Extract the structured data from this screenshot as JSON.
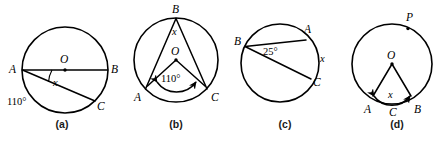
{
  "figure": {
    "type": "circle-geometry-diagram-set",
    "background_color": "#ffffff",
    "stroke_color": "#000000",
    "panel_count": 4
  },
  "panels": [
    {
      "id": "a",
      "caption": "(a)",
      "center_label": "O",
      "points": [
        {
          "name": "A",
          "label": "A",
          "position": "left"
        },
        {
          "name": "B",
          "label": "B",
          "position": "right"
        },
        {
          "name": "C",
          "label": "C",
          "position": "bottom-right"
        }
      ],
      "angle_labels": [
        {
          "label": "x",
          "at": "A",
          "type": "variable"
        },
        {
          "label": "110°",
          "at": "arc-AC",
          "type": "given"
        }
      ],
      "chords": [
        "AB",
        "AC"
      ],
      "notes": "AB is a diameter through center O; angle x at A between AB and AC; arc AC is 110 degrees"
    },
    {
      "id": "b",
      "caption": "(b)",
      "center_label": "O",
      "points": [
        {
          "name": "B",
          "label": "B",
          "position": "top"
        },
        {
          "name": "A",
          "label": "A",
          "position": "bottom-left"
        },
        {
          "name": "C",
          "label": "C",
          "position": "bottom-right"
        }
      ],
      "angle_labels": [
        {
          "label": "x",
          "at": "B",
          "type": "variable"
        },
        {
          "label": "110°",
          "at": "O",
          "type": "given"
        }
      ],
      "chords": [
        "BA",
        "BC"
      ],
      "radii": [
        "OA",
        "OC"
      ],
      "notes": "Central angle AOC is 110 degrees marked with double headed arc arrow; inscribed angle x at B"
    },
    {
      "id": "c",
      "caption": "(c)",
      "center_label": "",
      "points": [
        {
          "name": "B",
          "label": "B",
          "position": "left"
        },
        {
          "name": "A",
          "label": "A",
          "position": "top-right"
        },
        {
          "name": "C",
          "label": "C",
          "position": "right"
        }
      ],
      "angle_labels": [
        {
          "label": "25°",
          "at": "B",
          "type": "given"
        },
        {
          "label": "x",
          "at": "arc-AC",
          "type": "variable"
        }
      ],
      "chords": [
        "BA",
        "BC"
      ],
      "notes": "Inscribed angle at B is 25 degrees; x labels arc AC on the right"
    },
    {
      "id": "d",
      "caption": "(d)",
      "center_label": "O",
      "points": [
        {
          "name": "P",
          "label": "P",
          "position": "top-right"
        },
        {
          "name": "A",
          "label": "A",
          "position": "bottom-left"
        },
        {
          "name": "C",
          "label": "C",
          "position": "bottom"
        },
        {
          "name": "B",
          "label": "B",
          "position": "bottom-right"
        }
      ],
      "angle_labels": [
        {
          "label": "x",
          "at": "arc-ACB",
          "type": "variable"
        }
      ],
      "radii": [
        "OA",
        "OB"
      ],
      "notes": "Radii OA and OB drawn with arrowheads toward A and B; arc ACB labelled x; P marked on major arc"
    }
  ],
  "captions": {
    "a": "(a)",
    "b": "(b)",
    "c": "(c)",
    "d": "(d)"
  }
}
